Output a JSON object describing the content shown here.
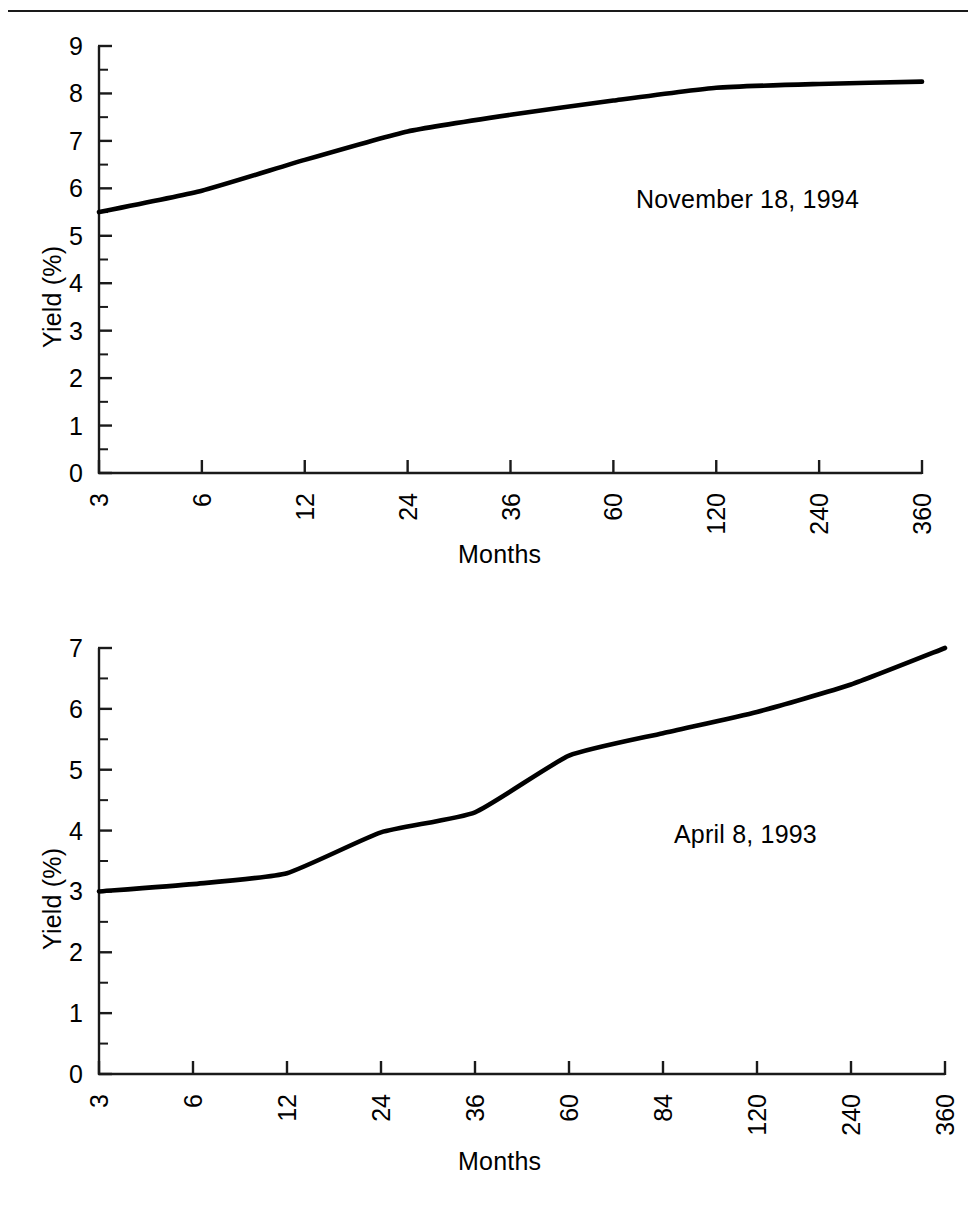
{
  "page": {
    "background_color": "#ffffff",
    "line_color": "#000000",
    "axis_color": "#1a1a1a",
    "divider_present": true
  },
  "chart_data": [
    {
      "id": "top",
      "type": "line",
      "title": "",
      "annotation": "November 18, 1994",
      "xlabel": "Months",
      "ylabel": "Yield (%)",
      "categories": [
        "3",
        "6",
        "12",
        "24",
        "36",
        "60",
        "120",
        "240",
        "360"
      ],
      "values": [
        5.5,
        5.95,
        6.6,
        7.2,
        7.55,
        7.85,
        8.12,
        8.2,
        8.25
      ],
      "ytick_labels": [
        "0",
        "1",
        "2",
        "3",
        "4",
        "5",
        "6",
        "7",
        "8",
        "9"
      ],
      "ylim": [
        0,
        9
      ],
      "minor_ticks": true,
      "grid": false,
      "legend": "none",
      "axis_scale": "categorical"
    },
    {
      "id": "bottom",
      "type": "line",
      "title": "",
      "annotation": "April 8, 1993",
      "xlabel": "Months",
      "ylabel": "Yield (%)",
      "categories": [
        "3",
        "6",
        "12",
        "24",
        "36",
        "60",
        "84",
        "120",
        "240",
        "360"
      ],
      "values": [
        3.0,
        3.12,
        3.3,
        3.97,
        4.3,
        5.23,
        5.6,
        5.95,
        6.4,
        7.0
      ],
      "ytick_labels": [
        "0",
        "1",
        "2",
        "3",
        "4",
        "5",
        "6",
        "7"
      ],
      "ylim": [
        0,
        7
      ],
      "minor_ticks": true,
      "grid": false,
      "legend": "none",
      "axis_scale": "categorical"
    }
  ]
}
